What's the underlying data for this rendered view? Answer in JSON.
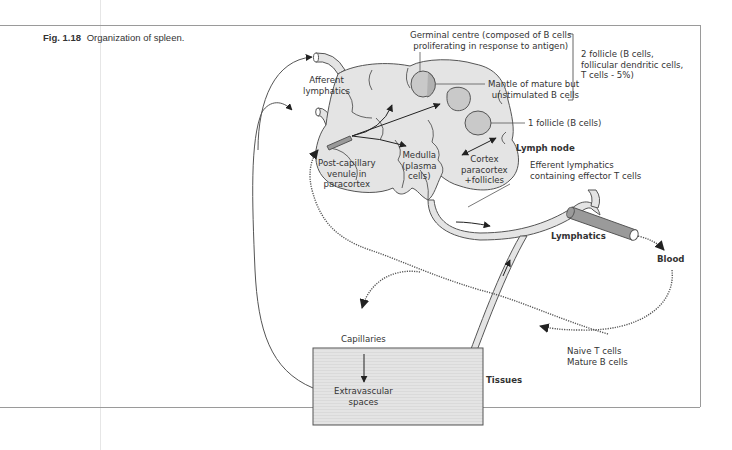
{
  "figure": {
    "number": "Fig. 1.18",
    "title": "Organization of spleen."
  },
  "labels": {
    "germinal_centre_line1": "Germinal centre (composed of B cells",
    "germinal_centre_line2": "proliferating in response to antigen)",
    "mantle_line1": "Mantle of mature but",
    "mantle_line2": "unstimulated B cells",
    "secondary_follicle_line1": "2 follicle (B cells,",
    "secondary_follicle_line2": "follicular dendritic cells,",
    "secondary_follicle_line3": "T cells - 5%)",
    "primary_follicle": "1 follicle (B cells)",
    "afferent_line1": "Afferent",
    "afferent_line2": "lymphatics",
    "lymph_node": "Lymph node",
    "post_capillary_line1": "Post-capillary",
    "post_capillary_line2": "venule in",
    "post_capillary_line3": "paracortex",
    "medulla_line1": "Medulla",
    "medulla_line2": "(plasma",
    "medulla_line3": "cells)",
    "cortex_line1": "Cortex",
    "cortex_line2": "paracortex",
    "cortex_line3": "+follicles",
    "efferent_line1": "Efferent lymphatics",
    "efferent_line2": "containing effector T cells",
    "lymphatics": "Lymphatics",
    "blood": "Blood",
    "capillaries": "Capillaries",
    "extravascular_line1": "Extravascular",
    "extravascular_line2": "spaces",
    "tissues": "Tissues",
    "naive_line1": "Naive T cells",
    "naive_line2": "Mature B cells"
  },
  "colors": {
    "node_fill": "#e4e4e4",
    "follicle_fill": "#c9c9c9",
    "tissue_fill": "#e2e2e2",
    "vessel_fill": "#9a9a9a",
    "line": "#555555"
  }
}
